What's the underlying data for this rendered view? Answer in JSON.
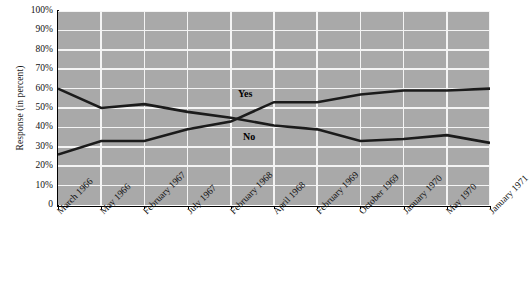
{
  "axes": {
    "ylabel": "Response (in percent)",
    "yticks": [
      "100%",
      "90%",
      "80%",
      "70%",
      "60%",
      "50%",
      "40%",
      "30%",
      "20%",
      "10%",
      "0"
    ],
    "xticks": [
      "March 1966",
      "May 1966",
      "February 1967",
      "July 1967",
      "February 1968",
      "April 1968",
      "February 1969",
      "October 1969",
      "January 1970",
      "May 1970",
      "January 1971"
    ]
  },
  "style": {
    "plot_background": "#a9a9a9",
    "gridline_color": "#f4f4f4",
    "line_color": "#1b1b1b",
    "axis_color": "#000000"
  },
  "annotations": [
    {
      "name": "yes-label",
      "text": "Yes",
      "x": 238,
      "y": 88
    },
    {
      "name": "no-label",
      "text": "No",
      "x": 243,
      "y": 131
    }
  ],
  "chart_data": {
    "type": "line",
    "title": "",
    "xlabel": "",
    "ylabel": "Response (in percent)",
    "ylim": [
      0,
      100
    ],
    "yticks": [
      0,
      10,
      20,
      30,
      40,
      50,
      60,
      70,
      80,
      90,
      100
    ],
    "grid": true,
    "legend": "inline-labels",
    "categories": [
      "March 1966",
      "May 1966",
      "February 1967",
      "July 1967",
      "February 1968",
      "April 1968",
      "February 1969",
      "October 1969",
      "January 1970",
      "May 1970",
      "January 1971"
    ],
    "series": [
      {
        "name": "Yes",
        "values": [
          26,
          33,
          33,
          39,
          43,
          53,
          53,
          57,
          59,
          59,
          60
        ]
      },
      {
        "name": "No",
        "values": [
          60,
          50,
          52,
          48,
          45,
          41,
          39,
          33,
          34,
          36,
          32
        ]
      }
    ]
  }
}
